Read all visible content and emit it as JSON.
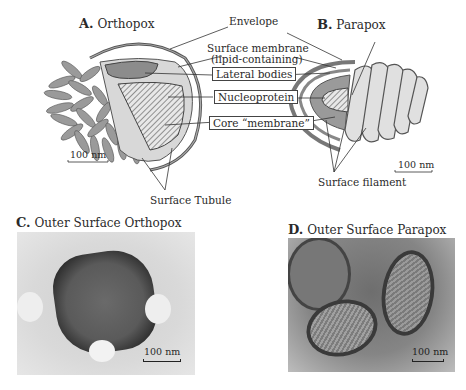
{
  "panels": {
    "a": {
      "letter": "A.",
      "title": "Orthopox"
    },
    "b": {
      "letter": "B.",
      "title": "Parapox"
    },
    "c": {
      "letter": "C.",
      "title": "Outer Surface Orthopox"
    },
    "d": {
      "letter": "D.",
      "title": "Outer Surface Parapox"
    }
  },
  "labels": {
    "envelope": "Envelope",
    "surface_membrane_1": "Surface membrane",
    "surface_membrane_2": "(lipid-containing)",
    "lateral_bodies": "Lateral bodies",
    "nucleoprotein": "Nucleoprotein",
    "core_membrane": "Core “membrane”",
    "surface_tubule": "Surface Tubule",
    "surface_filament": "Surface filament"
  },
  "scale_bars": {
    "a": "100 nm",
    "b": "100 nm",
    "c": "100 nm",
    "d": "100 nm"
  },
  "colors": {
    "outline": "#4a4a4a",
    "fill_gray": "#9a9a9a",
    "fill_light": "#d4d4d4",
    "photo_dark": "#3a3a3a",
    "photo_bg": "#cfcfcf"
  }
}
